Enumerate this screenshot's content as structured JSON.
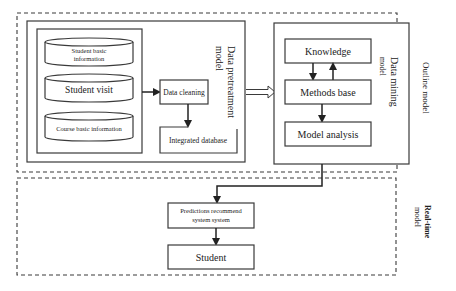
{
  "outline_model": {
    "label": "Outline model",
    "pretreatment": {
      "label_line1": "Data pretreatment",
      "label_line2": "model",
      "sources": [
        {
          "line1": "Student basic",
          "line2": "information"
        },
        {
          "line1": "Student visit",
          "line2": ""
        },
        {
          "line1": "Course basic information",
          "line2": ""
        }
      ],
      "data_cleaning": "Data cleaning",
      "integrated_database": "Integrated database"
    },
    "mining": {
      "label_line1": "Data mining",
      "label_line2": "model",
      "knowledge": "Knowledge",
      "methods_base": "Methods base",
      "model_analysis": "Model analysis"
    }
  },
  "realtime_model": {
    "label_line1": "Real-time",
    "label_line2": "model",
    "predictions_line1": "Predictions recommend",
    "predictions_line2": "system system",
    "student": "Student"
  }
}
